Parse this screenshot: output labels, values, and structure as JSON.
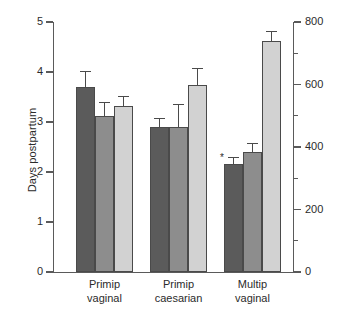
{
  "chart_data": {
    "type": "bar",
    "title": "",
    "subtitle": "",
    "xlabel": "",
    "ylabel": "Days postpartum",
    "y2label": "Milk production (g/day)",
    "categories": [
      "Primip vaginal",
      "Primip caesarian",
      "Multip vaginal"
    ],
    "category_lines": [
      [
        "Primip",
        "vaginal"
      ],
      [
        "Primip",
        "caesarian"
      ],
      [
        "Multip",
        "vaginal"
      ]
    ],
    "ylim": [
      0,
      5
    ],
    "y2lim": [
      0,
      800
    ],
    "yticks": [
      "0",
      "1",
      "2",
      "3",
      "4",
      "5"
    ],
    "ytick_values": [
      0,
      1,
      2,
      3,
      4,
      5
    ],
    "y2ticks": [
      "0",
      "200",
      "400",
      "600",
      "800"
    ],
    "y2tick_values": [
      0,
      200,
      400,
      600,
      800
    ],
    "y2_minor_values": [
      100,
      300,
      500,
      700
    ],
    "grid": false,
    "legend": "none",
    "annotations": [
      "*"
    ],
    "bars_per_group": 3,
    "series": [
      {
        "name": "series-1",
        "color": "#5b5b5b",
        "axis": "left",
        "values": [
          3.71,
          2.91,
          2.17
        ],
        "errors": [
          0.31,
          0.18,
          0.13
        ]
      },
      {
        "name": "series-2",
        "color": "#8d8d8d",
        "axis": "left",
        "values": [
          3.13,
          2.91,
          2.41
        ],
        "errors": [
          0.28,
          0.46,
          0.18
        ]
      },
      {
        "name": "series-3",
        "color": "#d2d2d2",
        "axis": "right",
        "values": [
          3.32,
          3.75,
          4.63
        ],
        "errors": [
          0.2,
          0.33,
          0.2
        ]
      }
    ],
    "series3_right_axis_values": [
      531,
      600,
      741
    ],
    "significance_marker": {
      "label": "*",
      "group": "Multip vaginal",
      "series": "series-1"
    }
  },
  "colors": {
    "axis": "#5a5a5a",
    "bar_outline": "#4a4a4a",
    "background": "#ffffff",
    "text": "#2b2b2b"
  }
}
